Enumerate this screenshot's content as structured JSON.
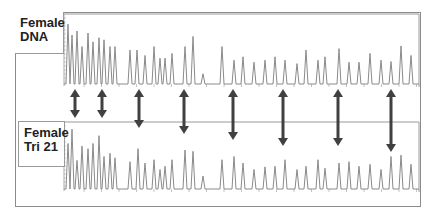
{
  "figure": {
    "panels": [
      {
        "label_line1": "Female",
        "label_line2": "DNA"
      },
      {
        "label_line1": "Female",
        "label_line2": "Tri 21"
      }
    ]
  },
  "colors": {
    "trace": "#8a8a8a",
    "arrow": "#404040",
    "frame": "#8c8c8c"
  },
  "chart_data": {
    "type": "line",
    "title": "",
    "series": [
      {
        "name": "Female DNA",
        "peaks_x": [
          68,
          72,
          77,
          82,
          88,
          93,
          99,
          104,
          110,
          115,
          130,
          137,
          145,
          154,
          160,
          165,
          172,
          185,
          193,
          203,
          222,
          234,
          243,
          254,
          265,
          275,
          285,
          297,
          306,
          318,
          325,
          339,
          349,
          359,
          370,
          381,
          391,
          401,
          411
        ],
        "peaks_height": [
          0.88,
          0.72,
          0.78,
          0.55,
          0.75,
          0.62,
          0.68,
          0.65,
          0.55,
          0.55,
          0.5,
          0.5,
          0.42,
          0.55,
          0.38,
          0.38,
          0.45,
          0.55,
          0.7,
          0.15,
          0.55,
          0.35,
          0.4,
          0.32,
          0.35,
          0.4,
          0.35,
          0.3,
          0.5,
          0.35,
          0.4,
          0.52,
          0.32,
          0.32,
          0.45,
          0.35,
          0.33,
          0.56,
          0.42
        ]
      },
      {
        "name": "Female Tri 21",
        "peaks_x": [
          68,
          72,
          77,
          82,
          88,
          93,
          99,
          104,
          110,
          115,
          130,
          138,
          145,
          154,
          160,
          165,
          172,
          185,
          193,
          203,
          222,
          234,
          243,
          254,
          265,
          275,
          285,
          297,
          306,
          318,
          325,
          339,
          349,
          359,
          370,
          381,
          391,
          401,
          411
        ],
        "peaks_height": [
          0.7,
          0.92,
          0.44,
          0.66,
          0.62,
          0.7,
          0.82,
          0.5,
          0.55,
          0.48,
          0.42,
          0.62,
          0.4,
          0.45,
          0.3,
          0.35,
          0.45,
          0.6,
          0.58,
          0.2,
          0.45,
          0.5,
          0.4,
          0.3,
          0.34,
          0.35,
          0.45,
          0.3,
          0.35,
          0.45,
          0.32,
          0.4,
          0.42,
          0.35,
          0.38,
          0.3,
          0.5,
          0.52,
          0.38
        ]
      }
    ],
    "annotations": {
      "arrows_x": [
        75,
        102,
        139,
        184,
        233,
        283,
        338,
        391
      ],
      "arrow_type": "double-headed",
      "note": "Arrows connect corresponding peaks between traces; longer arrows reach peaks of differing relative height"
    },
    "xlabel": "",
    "ylabel": "",
    "grid": false,
    "legend": "none"
  }
}
